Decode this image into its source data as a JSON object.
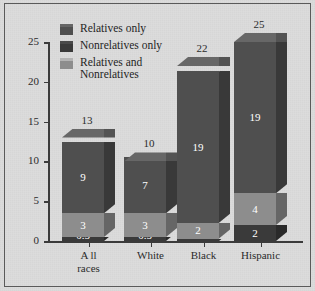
{
  "chart_data": {
    "type": "bar",
    "subtype": "stacked-3d-column",
    "title": "",
    "xlabel": "",
    "ylabel": "",
    "ylim": [
      0,
      25
    ],
    "yticks": [
      "0",
      "5",
      "10",
      "15",
      "20",
      "25"
    ],
    "grid": false,
    "legend_position": "top-left",
    "categories": [
      "A ll\nraces",
      "White",
      "Black",
      "Hispanic"
    ],
    "category_labels": [
      {
        "line1": "A ll",
        "line2": "races"
      },
      {
        "line1": "White",
        "line2": ""
      },
      {
        "line1": "Black",
        "line2": ""
      },
      {
        "line1": "Hispanic",
        "line2": ""
      }
    ],
    "series": [
      {
        "name": "Relatives only",
        "color": "#4f4f4f",
        "values": [
          9,
          7,
          19,
          19
        ],
        "labels": [
          "9",
          "7",
          "19",
          "19"
        ]
      },
      {
        "name": "Relatives and Nonrelatives",
        "color": "#8d8d8d",
        "values": [
          3,
          3,
          2,
          4
        ],
        "labels": [
          "3",
          "3",
          "2",
          "4"
        ]
      },
      {
        "name": "Nonrelatives only",
        "color": "#3a3a3a",
        "values": [
          0.5,
          0.5,
          0.3,
          2
        ],
        "labels": [
          "0.5",
          "0.5",
          "0.3",
          "2"
        ]
      }
    ],
    "stack_order_bottom_to_top": [
      "Nonrelatives only",
      "Relatives and Nonrelatives",
      "Relatives only"
    ],
    "totals": [
      13,
      10,
      22,
      25
    ],
    "total_labels": [
      "13",
      "10",
      "22",
      "25"
    ]
  },
  "legend": {
    "items": [
      {
        "label": "Relatives only",
        "label_line2": "",
        "color": "#4f4f4f"
      },
      {
        "label": "Nonrelatives only",
        "label_line2": "",
        "color": "#3a3a3a"
      },
      {
        "label": "Relatives and",
        "label_line2": "Nonrelatives",
        "color": "#8d8d8d"
      }
    ]
  },
  "colors": {
    "background": "#dcdcdc",
    "frame": "#5a5a5a",
    "axis": "#3b3b3b",
    "text": "#2b2b2b",
    "value_text": "#ffffff",
    "series_relatives_only": "#4f4f4f",
    "series_nonrelatives_only": "#3a3a3a",
    "series_both": "#8d8d8d"
  }
}
